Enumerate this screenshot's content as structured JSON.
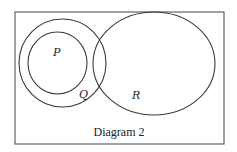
{
  "diagram": {
    "caption": "Diagram 2",
    "sets": [
      {
        "id": "P",
        "label": "P",
        "description": "inner circle, subset of Q"
      },
      {
        "id": "Q",
        "label": "Q",
        "description": "circle containing P"
      },
      {
        "id": "R",
        "label": "R",
        "description": "ellipse overlapping Q, disjoint from P"
      }
    ],
    "colors": {
      "stroke": "#3a3a3a",
      "frame": "#555555",
      "background": "#ffffff"
    }
  }
}
